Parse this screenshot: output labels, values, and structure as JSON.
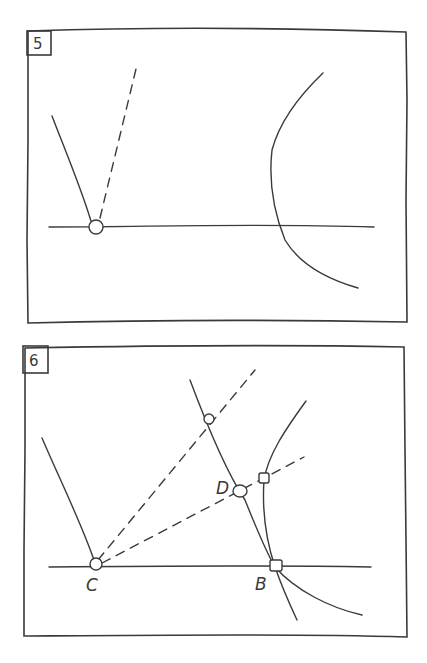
{
  "panels": [
    {
      "number": "5",
      "elements": [
        "horizontal line",
        "solid ray from point",
        "dashed ray from point",
        "hyperbola-like curve",
        "open point on line"
      ]
    },
    {
      "number": "6",
      "labels": {
        "C": "C",
        "B": "B",
        "D": "D"
      },
      "elements": [
        "horizontal line through C and B",
        "solid ray from C",
        "dashed rays from C",
        "line through B and D",
        "curve through B",
        "marked intersection points"
      ]
    }
  ],
  "colors": {
    "ink": "#3a3a3a",
    "background": "#ffffff"
  }
}
